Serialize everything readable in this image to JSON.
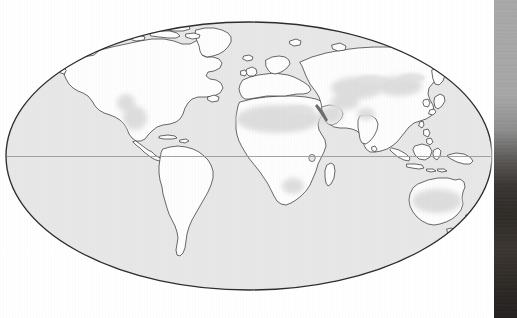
{
  "page": {
    "kind": "scanned-book-page",
    "width": 517,
    "height": 318,
    "background_color": "#ffffff",
    "caption": ""
  },
  "figure": {
    "title": "",
    "projection_name": "Mollweide (elliptical equal-area) world projection",
    "ocean_fill_color": "#e7e7e7",
    "land_fill_color": "#fdfdfd",
    "outline_color": "#3a3a3a",
    "graticule_color": "#9a9a9a",
    "arid_shading_color": "#dcdcdc",
    "frame_color": "#2d2d2d"
  },
  "map": {
    "ellipse": {
      "center_x": 249,
      "center_y": 156,
      "radius_x": 243,
      "radius_y": 134
    },
    "graticule": {
      "equator_label": "Equator",
      "equator_y": 156,
      "show_equator": true,
      "show_meridians": false,
      "show_parallels": false
    },
    "continents": [
      {
        "name": "North America"
      },
      {
        "name": "South America"
      },
      {
        "name": "Greenland"
      },
      {
        "name": "Europe"
      },
      {
        "name": "Africa"
      },
      {
        "name": "Asia"
      },
      {
        "name": "Australia"
      },
      {
        "name": "Indonesia / Maritime Southeast Asia"
      },
      {
        "name": "New Zealand"
      },
      {
        "name": "Madagascar"
      },
      {
        "name": "Japan"
      },
      {
        "name": "British Isles"
      },
      {
        "name": "Caribbean islands"
      },
      {
        "name": "Canadian Arctic Archipelago"
      },
      {
        "name": "Iceland"
      },
      {
        "name": "Sri Lanka"
      },
      {
        "name": "Taiwan"
      },
      {
        "name": "Philippines"
      },
      {
        "name": "Papua New Guinea"
      },
      {
        "name": "Tasmania"
      },
      {
        "name": "Svalbard"
      },
      {
        "name": "Novaya Zemlya"
      },
      {
        "name": "Lake Victoria"
      }
    ],
    "arid_regions": [
      {
        "name": "Sahara Desert"
      },
      {
        "name": "Arabian Desert"
      },
      {
        "name": "Central Asian deserts"
      },
      {
        "name": "Gobi Desert"
      },
      {
        "name": "Thar Desert"
      },
      {
        "name": "North American southwest deserts"
      },
      {
        "name": "Great Basin"
      },
      {
        "name": "Australian interior deserts"
      },
      {
        "name": "Kalahari Desert"
      },
      {
        "name": "Iranian Plateau"
      }
    ],
    "legend": {
      "visible": false,
      "entries": []
    },
    "labels": []
  },
  "scan_artifacts": {
    "right_edge_shadow": {
      "visible": true,
      "x_start": 494,
      "width": 23,
      "top_color": "#a9a9a9",
      "bottom_color": "#262220",
      "description": "page edge / binding shadow"
    }
  }
}
